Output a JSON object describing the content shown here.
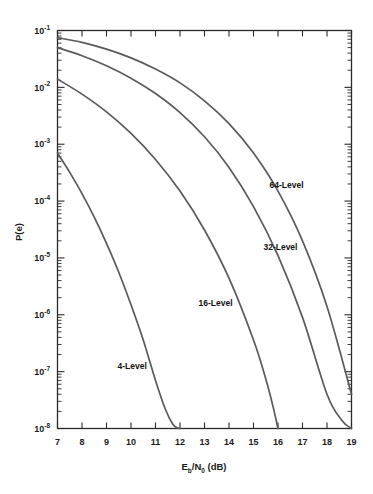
{
  "chart_data": {
    "type": "line",
    "title": "",
    "xlabel": "Eb/N0 (dB)",
    "ylabel": "P(e)",
    "xlabel_parts": {
      "lead": "E",
      "sub1": "b",
      "slash": "/N",
      "sub2": "0",
      "tail": " (dB)"
    },
    "xlim": [
      7,
      19
    ],
    "ylim": [
      1e-08,
      0.1
    ],
    "yscale": "log",
    "xscale": "linear",
    "grid": false,
    "legend": "inline-annotations",
    "xticks": [
      7,
      8,
      9,
      10,
      11,
      12,
      13,
      14,
      15,
      16,
      17,
      18,
      19
    ],
    "xtick_labels": [
      "7",
      "8",
      "9",
      "10",
      "11",
      "12",
      "13",
      "14",
      "15",
      "16",
      "17",
      "18",
      "19"
    ],
    "yticks": [
      0.1,
      0.01,
      0.001,
      0.0001,
      1e-05,
      1e-06,
      1e-07,
      1e-08
    ],
    "ytick_labels": [
      "10-1",
      "10-2",
      "10-3",
      "10-4",
      "10-5",
      "10-6",
      "10-7",
      "10-8"
    ],
    "ytick_mantissa": "10",
    "ytick_exponents": [
      "-1",
      "-2",
      "-3",
      "-4",
      "-5",
      "-6",
      "-7",
      "-8"
    ],
    "series": [
      {
        "name": "4-Level",
        "label": "4-Level",
        "label_x": 10.05,
        "label_y": 1.1e-07,
        "x": [
          7.0,
          7.5,
          8.0,
          8.5,
          9.0,
          9.5,
          10.0,
          10.5,
          11.0,
          11.4,
          11.7,
          11.9,
          12.0
        ],
        "y": [
          0.0007,
          0.00032,
          0.000135,
          5.2e-05,
          1.8e-05,
          5.6e-06,
          1.5e-06,
          3.6e-07,
          7e-08,
          2.2e-08,
          1.2e-08,
          1.02e-08,
          1e-08
        ]
      },
      {
        "name": "16-Level",
        "label": "16-Level",
        "label_x": 13.45,
        "label_y": 1.45e-06,
        "x": [
          7.0,
          8.0,
          9.0,
          10.0,
          11.0,
          12.0,
          13.0,
          14.0,
          15.0,
          15.5,
          15.8,
          16.0
        ],
        "y": [
          0.014,
          0.0076,
          0.0037,
          0.00155,
          0.00054,
          0.00015,
          3.1e-05,
          4.4e-06,
          3.6e-07,
          7.5e-08,
          2.4e-08,
          1e-08
        ]
      },
      {
        "name": "32-Level",
        "label": "32-Level",
        "label_x": 16.1,
        "label_y": 1.4e-05,
        "x": [
          7.0,
          8.0,
          9.0,
          10.0,
          11.0,
          12.0,
          13.0,
          14.0,
          15.0,
          16.0,
          17.0,
          18.0,
          18.6,
          19.0
        ],
        "y": [
          0.05,
          0.036,
          0.024,
          0.0145,
          0.0078,
          0.0036,
          0.00135,
          0.00039,
          8e-05,
          1.1e-05,
          9e-07,
          4e-08,
          1.4e-08,
          1e-08
        ]
      },
      {
        "name": "64-Level",
        "label": "64-Level",
        "label_x": 16.35,
        "label_y": 0.00017,
        "x": [
          7.0,
          8.0,
          9.0,
          10.0,
          11.0,
          12.0,
          13.0,
          14.0,
          15.0,
          16.0,
          17.0,
          18.0,
          19.0
        ],
        "y": [
          0.075,
          0.062,
          0.047,
          0.033,
          0.021,
          0.012,
          0.0058,
          0.0023,
          0.0007,
          0.00015,
          2e-05,
          1.4e-06,
          4e-08
        ]
      }
    ]
  },
  "colors": {
    "curve": "#5a5a5a",
    "axis": "#2a2a2a",
    "text": "#1a1a1a",
    "background": "#ffffff"
  }
}
